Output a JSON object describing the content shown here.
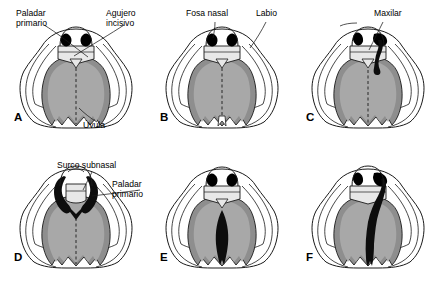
{
  "figure": {
    "title_alt": "Variantes de labio y paladar hendido",
    "colors": {
      "background": "#ffffff",
      "outline": "#1a1a1a",
      "palate_dark_gray": "#8e8e8e",
      "palate_mid_gray": "#a8a8a8",
      "palate_light_gray": "#dcdcdc",
      "premaxilla_gray": "#e8e8e8",
      "cleft_black": "#0d0d0d",
      "nostril_black": "#000000"
    },
    "panels": [
      {
        "letter": "A",
        "name": "normal-palate",
        "cleft": "none",
        "description": "Paladar normal"
      },
      {
        "letter": "B",
        "name": "cleft-uvula",
        "cleft": "uvula",
        "description": "Úvula hendida"
      },
      {
        "letter": "C",
        "name": "unilateral-cleft-lip",
        "cleft": "unilateral-lip",
        "description": "Labio hendido unilateral"
      },
      {
        "letter": "D",
        "name": "bilateral-cleft-lip",
        "cleft": "bilateral-lip",
        "description": "Labio hendido bilateral"
      },
      {
        "letter": "E",
        "name": "cleft-secondary-palate",
        "cleft": "secondary-palate",
        "description": "Paladar secundario hendido"
      },
      {
        "letter": "F",
        "name": "complete-unilateral-cleft",
        "cleft": "complete-unilateral",
        "description": "Labio y paladar hendido unilateral completo"
      }
    ],
    "labels": [
      {
        "id": "paladar-primario-a",
        "text": "Paladar\nprimario",
        "panel": "A"
      },
      {
        "id": "agujero-incisivo-a",
        "text": "Agujero\nincisivo",
        "panel": "A"
      },
      {
        "id": "uvula-a",
        "text": "Úvula",
        "panel": "A"
      },
      {
        "id": "fosa-nasal-b",
        "text": "Fosa nasal",
        "panel": "B"
      },
      {
        "id": "labio-b",
        "text": "Labio",
        "panel": "B"
      },
      {
        "id": "maxilar-c",
        "text": "Maxilar",
        "panel": "C"
      },
      {
        "id": "surco-subnasal-d",
        "text": "Surco subnasal",
        "panel": "D"
      },
      {
        "id": "paladar-primario-d",
        "text": "Paladar\nprimario",
        "panel": "D"
      }
    ]
  }
}
